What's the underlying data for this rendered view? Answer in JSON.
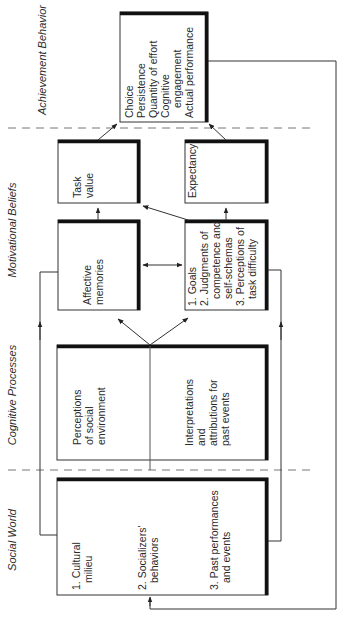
{
  "figure": {
    "type": "expectancy-value model flow diagram",
    "orientation": "rotated 90 degrees counter-clockwise",
    "columns": [
      {
        "id": "social",
        "label": "Social World"
      },
      {
        "id": "cognitive",
        "label": "Cognitive Processes"
      },
      {
        "id": "motivational",
        "label": "Motivational Beliefs"
      },
      {
        "id": "achievement",
        "label": "Achievement Behavior"
      }
    ],
    "boxes": {
      "social": {
        "lines1": [
          "1. Cultural",
          "   milieu"
        ],
        "lines2": [
          "2. Socializers'",
          "   behaviors"
        ],
        "lines3": [
          "3. Past performances",
          "   and events"
        ]
      },
      "perceptions": {
        "lines": [
          "Perceptions",
          "of social",
          "environment"
        ]
      },
      "interpretations": {
        "lines": [
          "Interpretations",
          "and",
          "attributions for",
          "past events"
        ]
      },
      "affective": {
        "lines": [
          "Affective",
          "memories"
        ]
      },
      "goals": {
        "lines": [
          "1. Goals",
          "2. Judgments of",
          "   competence and",
          "   self-schemas",
          "3. Perceptions of",
          "   task difficulty"
        ]
      },
      "task_value": {
        "lines": [
          "Task",
          "value"
        ]
      },
      "expectancy": {
        "lines": [
          "Expectancy"
        ]
      },
      "achievement": {
        "lines": [
          "Choice",
          "Persistence",
          "Quantity of effort",
          "Cognitive",
          "   engagement",
          "Actual performance"
        ]
      }
    }
  }
}
